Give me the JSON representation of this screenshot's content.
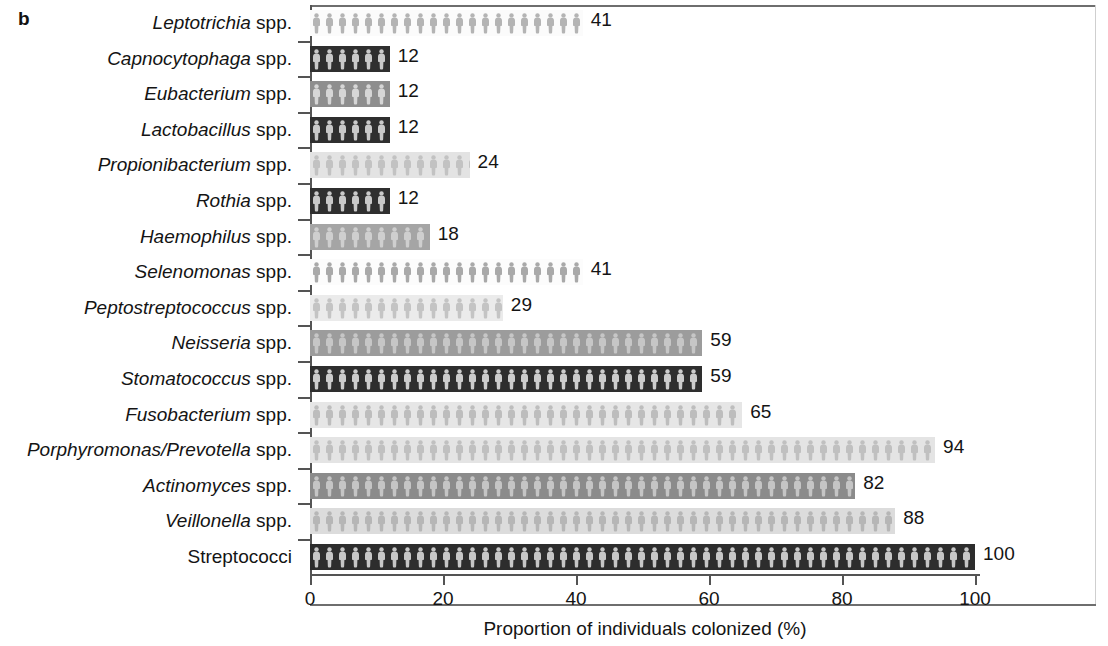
{
  "panel": {
    "label": "b"
  },
  "chart_data": {
    "type": "bar",
    "orientation": "horizontal",
    "title": "",
    "xlabel": "Proportion of individuals colonized (%)",
    "ylabel": "",
    "xlim": [
      0,
      100
    ],
    "xticks": [
      0,
      20,
      40,
      60,
      80,
      100
    ],
    "xticklabels": [
      "0",
      "20",
      "40",
      "60",
      "80",
      "100"
    ],
    "grid": false,
    "legend": "none",
    "categories": [
      "Leptotrichia spp.",
      "Capnocytophaga spp.",
      "Eubacterium spp.",
      "Lactobacillus spp.",
      "Propionibacterium spp.",
      "Rothia spp.",
      "Haemophilus spp.",
      "Selenomonas spp.",
      "Peptostreptococcus spp.",
      "Neisseria spp.",
      "Stomatococcus spp.",
      "Fusobacterium spp.",
      "Porphyromonas/Prevotella spp.",
      "Actinomyces spp.",
      "Veillonella spp.",
      "Streptococci"
    ],
    "values": [
      41,
      12,
      12,
      12,
      24,
      12,
      18,
      41,
      29,
      59,
      59,
      65,
      94,
      82,
      88,
      100
    ],
    "datalabels": [
      "41",
      "12",
      "12",
      "12",
      "24",
      "12",
      "18",
      "41",
      "29",
      "59",
      "59",
      "65",
      "94",
      "82",
      "88",
      "100"
    ],
    "bars": [
      {
        "genus": "Leptotrichia",
        "suffix": " spp.",
        "italic": true,
        "value": 41,
        "label": "41",
        "fill": "#fbfbfb",
        "glyph": "#b4b4b4"
      },
      {
        "genus": "Capnocytophaga",
        "suffix": " spp.",
        "italic": true,
        "value": 12,
        "label": "12",
        "fill": "#2f2f2f",
        "glyph": "#c9c9c9"
      },
      {
        "genus": "Eubacterium",
        "suffix": " spp.",
        "italic": true,
        "value": 12,
        "label": "12",
        "fill": "#8e8e8e",
        "glyph": "#d6d6d6"
      },
      {
        "genus": "Lactobacillus",
        "suffix": " spp.",
        "italic": true,
        "value": 12,
        "label": "12",
        "fill": "#2f2f2f",
        "glyph": "#c9c9c9"
      },
      {
        "genus": "Propionibacterium",
        "suffix": " spp.",
        "italic": true,
        "value": 24,
        "label": "24",
        "fill": "#e3e3e3",
        "glyph": "#c2c2c2"
      },
      {
        "genus": "Rothia",
        "suffix": " spp.",
        "italic": true,
        "value": 12,
        "label": "12",
        "fill": "#2f2f2f",
        "glyph": "#c9c9c9"
      },
      {
        "genus": "Haemophilus",
        "suffix": " spp.",
        "italic": true,
        "value": 18,
        "label": "18",
        "fill": "#a5a5a5",
        "glyph": "#cfcfcf"
      },
      {
        "genus": "Selenomonas",
        "suffix": " spp.",
        "italic": true,
        "value": 41,
        "label": "41",
        "fill": "#fcfcfc",
        "glyph": "#a9a9a9"
      },
      {
        "genus": "Peptostreptococcus",
        "suffix": " spp.",
        "italic": true,
        "value": 29,
        "label": "29",
        "fill": "#ebebeb",
        "glyph": "#c4c4c4"
      },
      {
        "genus": "Neisseria",
        "suffix": " spp.",
        "italic": true,
        "value": 59,
        "label": "59",
        "fill": "#9c9c9c",
        "glyph": "#c6c6c6"
      },
      {
        "genus": "Stomatococcus",
        "suffix": " spp.",
        "italic": true,
        "value": 59,
        "label": "59",
        "fill": "#2e2e2e",
        "glyph": "#cdcdcd"
      },
      {
        "genus": "Fusobacterium",
        "suffix": " spp.",
        "italic": true,
        "value": 65,
        "label": "65",
        "fill": "#e6e6e6",
        "glyph": "#bdbdbd"
      },
      {
        "genus": "Porphyromonas/Prevotella",
        "suffix": " spp.",
        "italic": true,
        "value": 94,
        "label": "94",
        "fill": "#e4e4e4",
        "glyph": "#c0c0c0"
      },
      {
        "genus": "Actinomyces",
        "suffix": " spp.",
        "italic": true,
        "value": 82,
        "label": "82",
        "fill": "#8b8b8b",
        "glyph": "#c5c5c5"
      },
      {
        "genus": "Veillonella",
        "suffix": " spp.",
        "italic": true,
        "value": 88,
        "label": "88",
        "fill": "#dcdcdc",
        "glyph": "#b6b6b6"
      },
      {
        "genus": "Streptococci",
        "suffix": "",
        "italic": false,
        "value": 100,
        "label": "100",
        "fill": "#2d2d2d",
        "glyph": "#c7c7c7"
      }
    ]
  },
  "axis": {
    "x_title": "Proportion of individuals colonized (%)",
    "tick_labels": [
      "0",
      "20",
      "40",
      "60",
      "80",
      "100"
    ]
  },
  "colors": {
    "axis_line": "#545454",
    "frame_line": "#6e6e6e",
    "text": "#141414",
    "background": "#ffffff"
  }
}
